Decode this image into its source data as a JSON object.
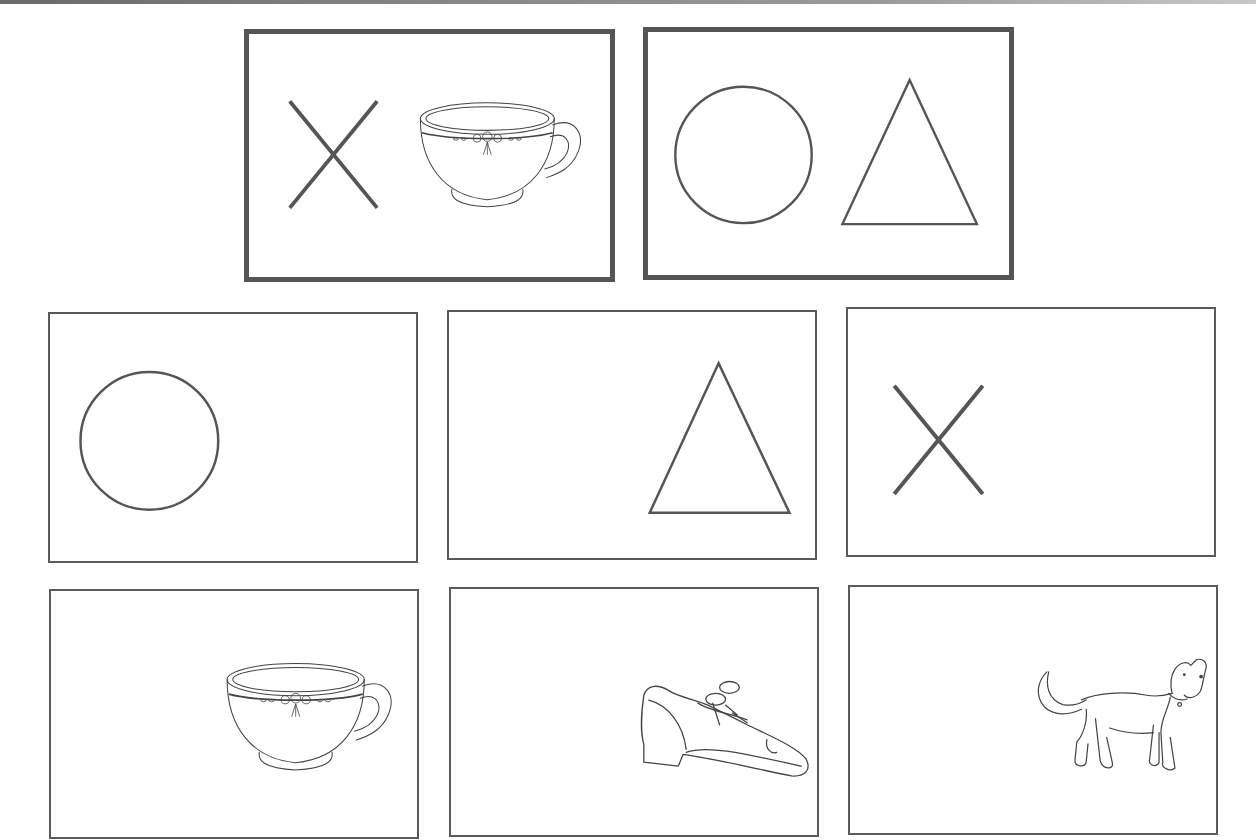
{
  "page": {
    "type": "picture-matching-worksheet",
    "colors": {
      "border": "#555555",
      "background": "#ffffff",
      "ink": "#444444"
    }
  },
  "target_cards": [
    {
      "id": "target-1",
      "items": [
        "x-mark",
        "teacup"
      ]
    },
    {
      "id": "target-2",
      "items": [
        "circle",
        "triangle"
      ]
    }
  ],
  "choice_cards": [
    {
      "id": "choice-1",
      "item": "circle"
    },
    {
      "id": "choice-2",
      "item": "triangle"
    },
    {
      "id": "choice-3",
      "item": "x-mark"
    },
    {
      "id": "choice-4",
      "item": "teacup"
    },
    {
      "id": "choice-5",
      "item": "shoe"
    },
    {
      "id": "choice-6",
      "item": "dog"
    }
  ]
}
